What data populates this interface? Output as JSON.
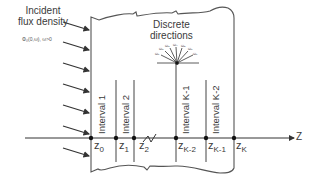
{
  "diagram": {
    "incident_label": [
      "Incident",
      "flux density"
    ],
    "incident_sub": "Φ₀(0,ω), ω>0",
    "discrete_label": [
      "Discrete",
      "directions"
    ],
    "omega_labels": [
      "ω₁",
      "ω₂",
      "ω₃",
      "ω₄",
      "ω₅",
      "ω₆",
      "ω₇"
    ],
    "intervals": [
      {
        "label": "Interval 1"
      },
      {
        "label": "Interval 2"
      },
      {
        "label": "Interval K-1"
      },
      {
        "label": "Interval K-2"
      }
    ],
    "nodes": [
      {
        "base": "z",
        "sub": "0"
      },
      {
        "base": "z",
        "sub": "1"
      },
      {
        "base": "z",
        "sub": "2"
      },
      {
        "base": "z",
        "sub": "K-2"
      },
      {
        "base": "z",
        "sub": "K-1"
      },
      {
        "base": "z",
        "sub": "K"
      }
    ],
    "axis_label": "Z",
    "colors": {
      "line": "#4a4a4a",
      "text": "#3a3a3a",
      "background": "#ffffff"
    }
  }
}
